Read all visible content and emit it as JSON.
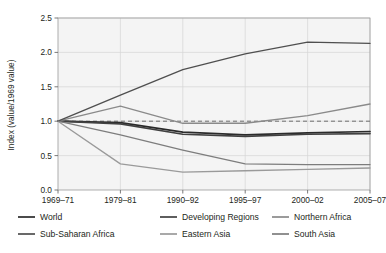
{
  "chart_data": {
    "type": "line",
    "title": "",
    "xlabel": "",
    "ylabel": "Index  (value/1969 value)",
    "categories": [
      "1969–71",
      "1979–81",
      "1990–92",
      "1995–97",
      "2000–02",
      "2005–07"
    ],
    "ylim": [
      0.0,
      2.5
    ],
    "ytick_labels": [
      "0.0",
      "0.5",
      "1.0",
      "1.5",
      "2.0",
      "2.5"
    ],
    "ytick_values": [
      0.0,
      0.5,
      1.0,
      1.5,
      2.0,
      2.5
    ],
    "grid": true,
    "legend_position": "bottom",
    "reference_line": {
      "value": 1.0,
      "style": "dashed",
      "color": "#6e6e6e"
    },
    "series": [
      {
        "name": "World",
        "color": "#2b2b2b",
        "width": 1.7,
        "values": [
          1.0,
          0.98,
          0.84,
          0.8,
          0.83,
          0.85
        ]
      },
      {
        "name": "Developing Regions",
        "color": "#414141",
        "width": 1.7,
        "values": [
          1.0,
          0.96,
          0.81,
          0.78,
          0.81,
          0.82
        ]
      },
      {
        "name": "Northern Africa",
        "color": "#8a8a8a",
        "width": 1.3,
        "values": [
          1.0,
          1.22,
          0.97,
          0.97,
          1.08,
          1.25
        ]
      },
      {
        "name": "Sub-Saharan Africa",
        "color": "#4f4f4f",
        "width": 1.3,
        "values": [
          1.0,
          1.38,
          1.75,
          1.98,
          2.15,
          2.13
        ]
      },
      {
        "name": "Eastern Asia",
        "color": "#9a9a9a",
        "width": 1.3,
        "values": [
          1.0,
          0.38,
          0.26,
          0.28,
          0.3,
          0.32
        ]
      },
      {
        "name": "South Asia",
        "color": "#7d7d7d",
        "width": 1.3,
        "values": [
          1.0,
          0.8,
          0.58,
          0.38,
          0.37,
          0.37
        ]
      }
    ]
  },
  "legend": {
    "entries": [
      {
        "label": "World",
        "color": "#2b2b2b"
      },
      {
        "label": "Developing Regions",
        "color": "#414141"
      },
      {
        "label": "Northern Africa",
        "color": "#8a8a8a"
      },
      {
        "label": "Sub-Saharan Africa",
        "color": "#4f4f4f"
      },
      {
        "label": "Eastern Asia",
        "color": "#9a9a9a"
      },
      {
        "label": "South Asia",
        "color": "#7d7d7d"
      }
    ]
  }
}
